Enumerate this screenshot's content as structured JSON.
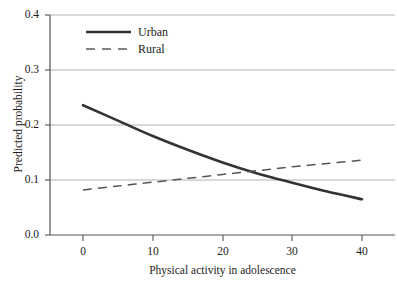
{
  "chart_data": {
    "type": "line",
    "title": "",
    "xlabel": "Physical activity in adolescence",
    "ylabel": "Predicted probability",
    "xlim": [
      -2,
      45
    ],
    "ylim": [
      0.0,
      0.4
    ],
    "xticks": [
      "0",
      "10",
      "20",
      "30",
      "40"
    ],
    "xtick_values": [
      0,
      10,
      20,
      30,
      40
    ],
    "yticks": [
      "0.0",
      "0.1",
      "0.2",
      "0.3",
      "0.4"
    ],
    "ytick_values": [
      0.0,
      0.1,
      0.2,
      0.3,
      0.4
    ],
    "grid": "horizontal",
    "legend_position": "upper-left-inside",
    "series": [
      {
        "name": "Urban",
        "style": "solid",
        "color": "#333333",
        "x": [
          0,
          5,
          10,
          15,
          20,
          25,
          30,
          35,
          40
        ],
        "values": [
          0.236,
          0.208,
          0.18,
          0.155,
          0.132,
          0.112,
          0.095,
          0.079,
          0.065
        ]
      },
      {
        "name": "Rural",
        "style": "dashed",
        "color": "#555555",
        "x": [
          0,
          5,
          10,
          15,
          20,
          25,
          30,
          35,
          40
        ],
        "values": [
          0.082,
          0.089,
          0.096,
          0.103,
          0.11,
          0.117,
          0.124,
          0.13,
          0.136
        ]
      }
    ]
  },
  "axes": {
    "ylabel": "Predicted probability",
    "xlabel": "Physical activity in adolescence",
    "yticks": [
      {
        "label": "0.4"
      },
      {
        "label": "0.3"
      },
      {
        "label": "0.2"
      },
      {
        "label": "0.1"
      },
      {
        "label": "0.0"
      }
    ],
    "xticks": [
      {
        "label": "0"
      },
      {
        "label": "10"
      },
      {
        "label": "20"
      },
      {
        "label": "30"
      },
      {
        "label": "40"
      }
    ]
  },
  "legend": {
    "entries": [
      {
        "label": "Urban",
        "style": "solid"
      },
      {
        "label": "Rural",
        "style": "dashed"
      }
    ]
  },
  "colors": {
    "axis": "#555555",
    "grid": "#a9a9a9",
    "urban_line": "#2f2f2f",
    "rural_line": "#5a5a5a",
    "text": "#1d1d1d",
    "background": "#ffffff"
  }
}
